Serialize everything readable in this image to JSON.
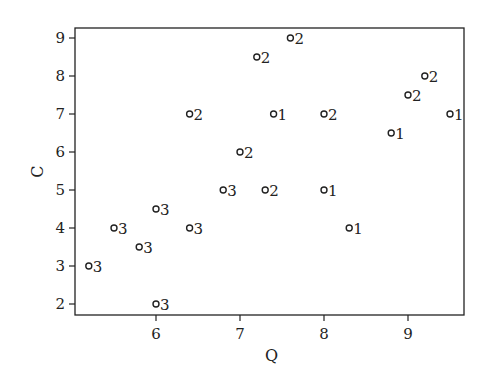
{
  "chart_data": {
    "type": "scatter",
    "title": "",
    "xlabel": "Q",
    "ylabel": "C",
    "xlim": [
      5.05,
      9.68
    ],
    "ylim": [
      1.7,
      9.26
    ],
    "xticks": [
      6,
      7,
      8,
      9
    ],
    "yticks": [
      2,
      3,
      4,
      5,
      6,
      7,
      8,
      9
    ],
    "grid": false,
    "legend": null,
    "marker": "open-circle",
    "point_labels_meaning": "group id printed to the right of each point",
    "points": [
      {
        "x": 5.2,
        "y": 3.0,
        "label": "3"
      },
      {
        "x": 5.5,
        "y": 4.0,
        "label": "3"
      },
      {
        "x": 5.8,
        "y": 3.5,
        "label": "3"
      },
      {
        "x": 6.0,
        "y": 4.5,
        "label": "3"
      },
      {
        "x": 6.0,
        "y": 2.0,
        "label": "3"
      },
      {
        "x": 6.4,
        "y": 4.0,
        "label": "3"
      },
      {
        "x": 6.4,
        "y": 7.0,
        "label": "2"
      },
      {
        "x": 6.8,
        "y": 5.0,
        "label": "3"
      },
      {
        "x": 7.0,
        "y": 6.0,
        "label": "2"
      },
      {
        "x": 7.2,
        "y": 8.5,
        "label": "2"
      },
      {
        "x": 7.3,
        "y": 5.0,
        "label": "2"
      },
      {
        "x": 7.4,
        "y": 7.0,
        "label": "1"
      },
      {
        "x": 7.6,
        "y": 9.0,
        "label": "2"
      },
      {
        "x": 8.0,
        "y": 7.0,
        "label": "2"
      },
      {
        "x": 8.0,
        "y": 5.0,
        "label": "1"
      },
      {
        "x": 8.3,
        "y": 4.0,
        "label": "1"
      },
      {
        "x": 8.8,
        "y": 6.5,
        "label": "1"
      },
      {
        "x": 9.0,
        "y": 7.5,
        "label": "2"
      },
      {
        "x": 9.2,
        "y": 8.0,
        "label": "2"
      },
      {
        "x": 9.5,
        "y": 7.0,
        "label": "1"
      }
    ],
    "series": [
      {
        "name": "1",
        "x": [
          7.4,
          8.0,
          8.3,
          8.8,
          9.5
        ],
        "y": [
          7.0,
          5.0,
          4.0,
          6.5,
          7.0
        ]
      },
      {
        "name": "2",
        "x": [
          6.4,
          7.0,
          7.2,
          7.3,
          7.6,
          8.0,
          9.0,
          9.2
        ],
        "y": [
          7.0,
          6.0,
          8.5,
          5.0,
          9.0,
          7.0,
          7.5,
          8.0
        ]
      },
      {
        "name": "3",
        "x": [
          5.2,
          5.5,
          5.8,
          6.0,
          6.0,
          6.4,
          6.8
        ],
        "y": [
          3.0,
          4.0,
          3.5,
          4.5,
          2.0,
          4.0,
          5.0
        ]
      }
    ]
  },
  "layout": {
    "frame": {
      "left": 75,
      "top": 28,
      "right": 464,
      "bottom": 315
    },
    "x_map": {
      "v0": 6,
      "px0": 156,
      "px_per_unit": 84
    },
    "y_map": {
      "v0": 2,
      "px0": 304,
      "px_per_unit": -38
    }
  }
}
